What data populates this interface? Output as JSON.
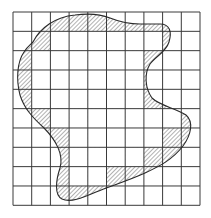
{
  "figure": {
    "type": "grid-area-estimation",
    "grid": {
      "rows": 10,
      "cols": 10,
      "origin": [
        13,
        12
      ],
      "cell_width": 18.7,
      "cell_height": 19.33,
      "line_color": "#3a3a3a"
    },
    "shape": {
      "outline_color": "#2a2a2a",
      "hatch_color": "#555555",
      "description": "irregular closed curve overlaid on grid"
    },
    "interior_cells_by_row": [
      [],
      [
        2,
        3,
        4,
        5,
        6,
        7
      ],
      [
        1,
        2,
        3,
        4,
        5,
        6
      ],
      [
        1,
        2,
        3,
        4,
        5,
        6
      ],
      [
        1,
        2,
        3,
        4,
        5,
        6
      ],
      [
        2,
        3,
        4,
        5,
        6,
        7,
        8
      ],
      [
        3,
        4,
        5,
        6,
        7
      ],
      [
        3,
        4,
        5,
        6
      ],
      [
        3,
        4
      ],
      []
    ],
    "boundary_cells_hatched": true
  }
}
